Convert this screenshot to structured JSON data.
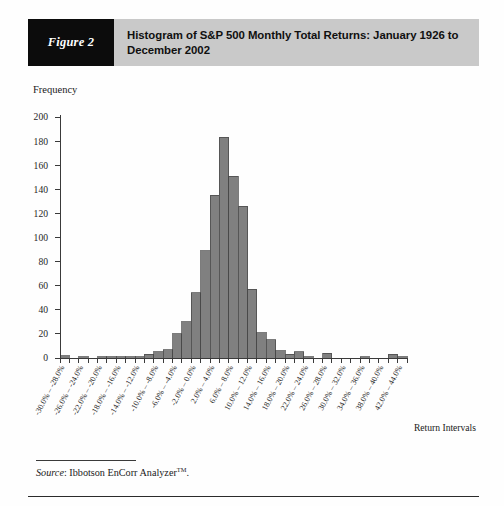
{
  "figure": {
    "tag": "Figure 2",
    "title": "Histogram of S&P 500 Monthly Total Returns: January 1926 to December 2002",
    "source_label": "Source",
    "source_text": ": Ibbotson EnCorr Analyzer",
    "source_trademark": "TM",
    "source_period": "."
  },
  "chart_data": {
    "type": "bar",
    "title": "Histogram of S&P 500 Monthly Total Returns: January 1926 to December 2002",
    "xlabel": "Return Intervals",
    "ylabel": "Frequency",
    "ylim": [
      0,
      200
    ],
    "ytick_values": [
      0,
      20,
      40,
      60,
      80,
      100,
      120,
      140,
      160,
      180,
      200
    ],
    "ytick_labels": [
      "0",
      "20",
      "40",
      "60",
      "80",
      "100",
      "120",
      "140",
      "160",
      "180",
      "200"
    ],
    "grid": false,
    "legend": "none",
    "bin_width_percent": 2,
    "categories": [
      "-30.0% – -28.0%",
      "-28.0% – -26.0%",
      "-26.0% – -24.0%",
      "-24.0% – -22.0%",
      "-22.0% – -20.0%",
      "-20.0% – -18.0%",
      "-18.0% – -16.0%",
      "-16.0% – -14.0%",
      "-14.0% – -12.0%",
      "-12.0% – -10.0%",
      "-10.0% – -8.0%",
      "-8.0% – -6.0%",
      "-6.0% – -4.0%",
      "-4.0% – -2.0%",
      "-2.0% – 0.0%",
      "0.0% – 2.0%",
      "2.0% – 4.0%",
      "4.0% – 6.0%",
      "6.0% – 8.0%",
      "8.0% – 10.0%",
      "10.0% – 12.0%",
      "12.0% – 14.0%",
      "14.0% – 16.0%",
      "16.0% – 18.0%",
      "18.0% – 20.0%",
      "20.0% – 22.0%",
      "22.0% – 24.0%",
      "24.0% – 26.0%",
      "26.0% – 28.0%",
      "28.0% – 30.0%",
      "30.0% – 32.0%",
      "32.0% – 34.0%",
      "34.0% – 36.0%",
      "36.0% – 38.0%",
      "38.0% – 40.0%",
      "40.0% – 42.0%",
      "42.0% – 44.0%"
    ],
    "xtick_labels": [
      "-30.0% – -28.0%",
      "-26.0% – -24.0%",
      "-22.0% – -20.0%",
      "-18.0% – -16.0%",
      "-14.0% – -12.0%",
      "-10.0% – -8.0%",
      "-6.0% – -4.0%",
      "-2.0% – 0.0%",
      "2.0% – 4.0%",
      "6.0% – 8.0%",
      "10.0% – 12.0%",
      "14.0% – 16.0%",
      "18.0% – 20.0%",
      "22.0% – 24.0%",
      "26.0% – 28.0%",
      "30.0% – 32.0%",
      "34.0% – 36.0%",
      "38.0% – 40.0%",
      "42.0% – 44.0%"
    ],
    "xtick_indices": [
      0,
      2,
      4,
      6,
      8,
      10,
      12,
      14,
      16,
      18,
      20,
      22,
      24,
      26,
      28,
      30,
      32,
      34,
      36
    ],
    "values": [
      2,
      0,
      1,
      0,
      1,
      1,
      1,
      1,
      1,
      3,
      5,
      7,
      20,
      30,
      54,
      89,
      135,
      183,
      151,
      126,
      57,
      21,
      15,
      6,
      3,
      5,
      1,
      0,
      4,
      0,
      0,
      0,
      1,
      0,
      0,
      3,
      1
    ],
    "colors": {
      "bar_fill": "#808080",
      "bar_stroke": "#454545",
      "axis": "#3a3a3a",
      "header_band": "#c9c9c9",
      "header_tag_bg": "#0c0c0c"
    }
  }
}
